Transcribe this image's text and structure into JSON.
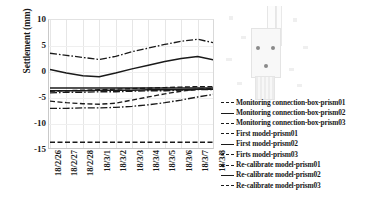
{
  "chart_data": {
    "type": "line",
    "title": "",
    "xlabel": "",
    "ylabel": "Settlement (mm)",
    "ylim": [
      -15,
      10
    ],
    "yticks": [
      10,
      5,
      0,
      -5,
      -10,
      -15
    ],
    "grid": true,
    "legend_position": "right",
    "x": [
      "18/2/26",
      "18/2/27",
      "18/2/28",
      "18/3/1",
      "18/3/2",
      "18/3/3",
      "18/3/4",
      "18/3/5",
      "18/3/6",
      "18/3/7",
      "18/3/8"
    ],
    "series": [
      {
        "name": "Monitoring connection-box-prism01",
        "style": "dashdot",
        "values": [
          3.6,
          3.2,
          2.8,
          2.4,
          3.0,
          3.9,
          4.6,
          5.3,
          5.9,
          6.3,
          5.6
        ]
      },
      {
        "name": "Monitoring connection-box-prism02",
        "style": "solid",
        "values": [
          0.5,
          -0.2,
          -0.7,
          -0.9,
          -0.2,
          0.6,
          1.3,
          2.0,
          2.6,
          3.0,
          2.3
        ]
      },
      {
        "name": "Monitoring connection-box-prism03",
        "style": "dashed",
        "values": [
          -5.6,
          -5.9,
          -6.1,
          -6.2,
          -6.0,
          -5.4,
          -4.8,
          -4.2,
          -3.7,
          -3.3,
          -3.2
        ]
      },
      {
        "name": "First model-prism01",
        "style": "dashdot",
        "values": [
          -4.0,
          -3.9,
          -3.9,
          -3.8,
          -3.8,
          -3.7,
          -3.6,
          -3.6,
          -3.5,
          -3.4,
          -3.4
        ]
      },
      {
        "name": "First model-prism02",
        "style": "solid",
        "values": [
          -3.1,
          -3.1,
          -3.1,
          -3.1,
          -3.1,
          -3.1,
          -3.1,
          -3.1,
          -3.1,
          -3.1,
          -3.1
        ]
      },
      {
        "name": "Firts model-prism03",
        "style": "dashed",
        "values": [
          -13.5,
          -13.5,
          -13.5,
          -13.5,
          -13.5,
          -13.5,
          -13.5,
          -13.5,
          -13.5,
          -13.5,
          -13.5
        ]
      },
      {
        "name": "Re-calibrate model-prism01",
        "style": "dashdot",
        "values": [
          -7.0,
          -7.0,
          -6.9,
          -6.9,
          -6.8,
          -6.6,
          -6.3,
          -5.9,
          -5.4,
          -4.8,
          -4.3
        ]
      },
      {
        "name": "Re-calibrate model-prism02",
        "style": "solid",
        "values": [
          -3.6,
          -3.6,
          -3.6,
          -3.5,
          -3.5,
          -3.5,
          -3.4,
          -3.4,
          -3.4,
          -3.3,
          -3.3
        ]
      },
      {
        "name": "Re-calibrate model-prism03",
        "style": "dashed",
        "values": [
          -3.7,
          -3.6,
          -3.5,
          -3.4,
          -3.3,
          -3.2,
          -3.1,
          -3.0,
          -2.9,
          -2.8,
          -2.8
        ]
      }
    ]
  },
  "inset": {
    "name": "connection-box-photo",
    "prism_labels": [
      "02",
      "03",
      "01"
    ]
  },
  "colors": {
    "line": "#1a1a1a",
    "grid": "#e6e6e6",
    "axis": "#c9c9c9",
    "background": "#ffffff"
  }
}
